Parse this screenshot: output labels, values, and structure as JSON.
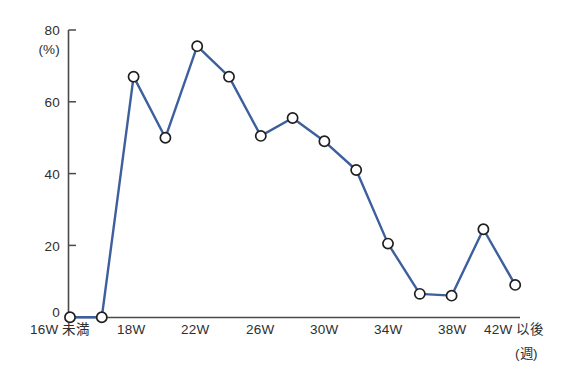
{
  "chart_data": {
    "type": "line",
    "title": "",
    "subtitle": "",
    "xlabel": "(週)",
    "ylabel": "(%)",
    "ylim": [
      0,
      80
    ],
    "yticks": [
      0,
      20,
      40,
      60,
      80
    ],
    "ytick_labels": [
      "0",
      "20",
      "40",
      "60",
      "80"
    ],
    "xtick_labels": [
      "16W 未満",
      "18W",
      "22W",
      "26W",
      "30W",
      "34W",
      "38W",
      "42W 以後"
    ],
    "grid": false,
    "legend": null,
    "marker": "open-circle",
    "line_color": "#3d5f9e",
    "marker_fill": "#ffffff",
    "marker_edge": "#1f1f1f",
    "x": [
      "16W未満",
      "17W",
      "18W",
      "20W",
      "22W",
      "24W",
      "26W",
      "28W",
      "30W",
      "32W",
      "34W",
      "36W",
      "38W",
      "40W",
      "42W以後"
    ],
    "values": [
      0,
      0,
      67,
      50,
      75.5,
      67,
      50.5,
      55.5,
      49,
      41,
      20.5,
      6.5,
      6,
      24.5,
      9
    ],
    "series": [
      {
        "name": "",
        "values": [
          0,
          0,
          67,
          50,
          75.5,
          67,
          50.5,
          55.5,
          49,
          41,
          20.5,
          6.5,
          6,
          24.5,
          9
        ]
      }
    ]
  },
  "axis": {
    "y_unit": "(%)",
    "x_unit": "(週)",
    "y_tick_0": "0",
    "y_tick_20": "20",
    "y_tick_40": "40",
    "y_tick_60": "60",
    "y_tick_80": "80",
    "x_tick_1": "16W 未満",
    "x_tick_2": "18W",
    "x_tick_3": "22W",
    "x_tick_4": "26W",
    "x_tick_5": "30W",
    "x_tick_6": "34W",
    "x_tick_7": "38W",
    "x_tick_8": "42W 以後"
  }
}
